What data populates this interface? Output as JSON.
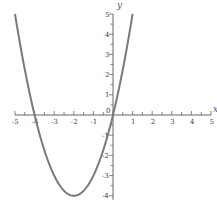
{
  "chart_data": {
    "type": "line",
    "title": "",
    "xlabel": "x",
    "ylabel": "y",
    "function": "y = x^2 + 4x",
    "xlim": [
      -5,
      5
    ],
    "ylim": [
      -4,
      5
    ],
    "grid": false,
    "legend": null,
    "x_ticks": [
      "-5",
      "-4",
      "-3",
      "-2",
      "-1",
      "0",
      "1",
      "2",
      "3",
      "4",
      "5"
    ],
    "y_ticks": [
      "-4",
      "-3",
      "-2",
      "-1",
      "1",
      "2",
      "3",
      "4",
      "5"
    ],
    "series": [
      {
        "name": "curve",
        "color": "#7a7a7a",
        "x": [
          -5,
          -4.5,
          -4,
          -3.5,
          -3,
          -2.5,
          -2,
          -1.5,
          -1,
          -0.5,
          0,
          0.5,
          1
        ],
        "y": [
          5,
          2.25,
          0,
          -1.75,
          -3,
          -3.75,
          -4,
          -3.75,
          -3,
          -1.75,
          0,
          2.25,
          5
        ]
      }
    ],
    "annotations": [
      "vertex (-2, -4)",
      "roots x = -4, x = 0"
    ]
  },
  "axes": {
    "x_label": "x",
    "y_label": "y",
    "origin_label": "0"
  }
}
